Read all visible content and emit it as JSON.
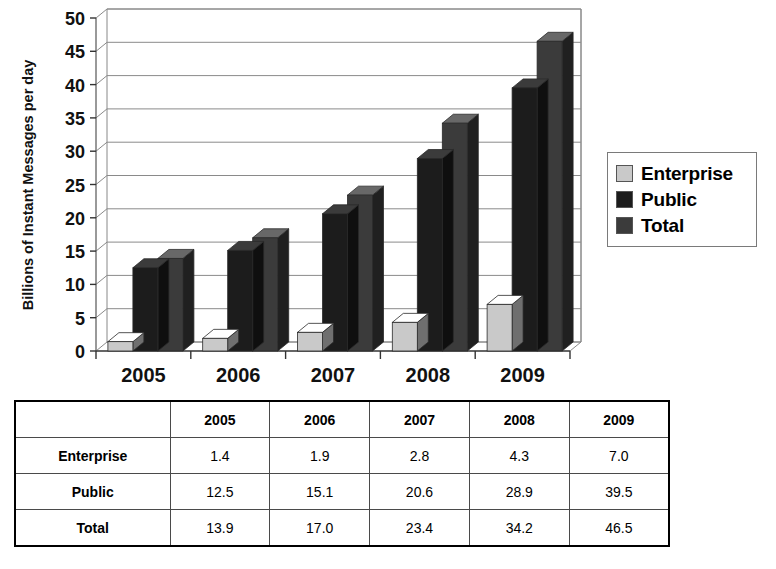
{
  "chart_data": {
    "type": "bar",
    "title": "",
    "xlabel": "",
    "ylabel": "Billions of Instant Messages per day",
    "categories": [
      "2005",
      "2006",
      "2007",
      "2008",
      "2009"
    ],
    "series": [
      {
        "name": "Enterprise",
        "values": [
          1.4,
          1.9,
          2.8,
          4.3,
          7.0
        ],
        "color": "#c9c9c9"
      },
      {
        "name": "Public",
        "values": [
          12.5,
          15.1,
          20.6,
          28.9,
          39.5
        ],
        "color": "#1c1c1c"
      },
      {
        "name": "Total",
        "values": [
          13.9,
          17.0,
          23.4,
          34.2,
          46.5
        ],
        "color": "#3b3b3b"
      }
    ],
    "ylim": [
      0,
      50
    ],
    "yticks": [
      0,
      5,
      10,
      15,
      20,
      25,
      30,
      35,
      40,
      45,
      50
    ],
    "ytick_labels": [
      "0",
      "5",
      "10",
      "15",
      "20",
      "25",
      "30",
      "35",
      "40",
      "45",
      "50"
    ],
    "grid": true,
    "grid_axis": "y",
    "legend_position": "right",
    "style": "3d-column"
  },
  "legend": {
    "items": [
      {
        "label": "Enterprise",
        "color": "#c9c9c9"
      },
      {
        "label": "Public",
        "color": "#1c1c1c"
      },
      {
        "label": "Total",
        "color": "#3b3b3b"
      }
    ]
  },
  "table": {
    "corner_label": "",
    "columns": [
      "2005",
      "2006",
      "2007",
      "2008",
      "2009"
    ],
    "rows": [
      {
        "label": "Enterprise",
        "cells": [
          "1.4",
          "1.9",
          "2.8",
          "4.3",
          "7.0"
        ]
      },
      {
        "label": "Public",
        "cells": [
          "12.5",
          "15.1",
          "20.6",
          "28.9",
          "39.5"
        ]
      },
      {
        "label": "Total",
        "cells": [
          "13.9",
          "17.0",
          "23.4",
          "34.2",
          "46.5"
        ]
      }
    ]
  }
}
